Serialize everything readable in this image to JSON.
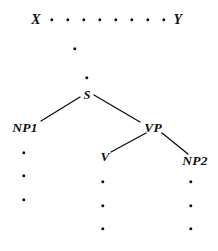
{
  "diagram": {
    "type": "tree",
    "ink_color": "#111111",
    "background_color": "#ffffff",
    "width": 218,
    "height": 251
  },
  "nodes": [
    {
      "id": "X",
      "label": "X",
      "x": 36,
      "y": 20,
      "size": "terminal"
    },
    {
      "id": "Y",
      "label": "Y",
      "x": 178,
      "y": 20,
      "size": "terminal"
    },
    {
      "id": "S",
      "label": "S",
      "x": 87,
      "y": 95,
      "size": "root"
    },
    {
      "id": "NP1",
      "label": "NP1",
      "x": 25,
      "y": 128,
      "size": "cat"
    },
    {
      "id": "VP",
      "label": "VP",
      "x": 153,
      "y": 128,
      "size": "cat"
    },
    {
      "id": "V",
      "label": "V",
      "x": 105,
      "y": 157,
      "size": "cat"
    },
    {
      "id": "NP2",
      "label": "NP2",
      "x": 195,
      "y": 161,
      "size": "cat"
    }
  ],
  "edges": [
    {
      "id": "s-np1",
      "from": "S",
      "to": "NP1",
      "x1": 80,
      "y1": 97,
      "x2": 41,
      "y2": 121
    },
    {
      "id": "s-vp",
      "from": "S",
      "to": "VP",
      "x1": 94,
      "y1": 95,
      "x2": 140,
      "y2": 122
    },
    {
      "id": "vp-v",
      "from": "VP",
      "to": "V",
      "x1": 146,
      "y1": 133,
      "x2": 111,
      "y2": 152
    },
    {
      "id": "vp-np2",
      "from": "VP",
      "to": "NP2",
      "x1": 162,
      "y1": 133,
      "x2": 188,
      "y2": 154
    }
  ],
  "ellipsis": {
    "top_row": {
      "id": "top-row-dots",
      "count": 8,
      "y": 20,
      "x_positions": [
        52,
        68,
        84,
        100,
        116,
        132,
        148,
        164
      ]
    },
    "spine": {
      "id": "spine-dots",
      "points": [
        {
          "x": 75,
          "y": 49
        },
        {
          "x": 87,
          "y": 78
        }
      ]
    },
    "columns": [
      {
        "id": "np1-column",
        "under": "NP1",
        "x": 24,
        "y_positions": [
          153,
          176,
          200
        ]
      },
      {
        "id": "v-column",
        "under": "V",
        "x": 103,
        "y_positions": [
          182,
          206,
          229
        ]
      },
      {
        "id": "np2-column",
        "under": "NP2",
        "x": 191,
        "y_positions": [
          182,
          206,
          229
        ]
      }
    ]
  }
}
